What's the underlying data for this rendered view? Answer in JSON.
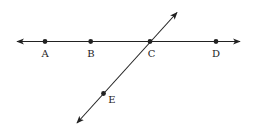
{
  "diagram": {
    "type": "geometry-lines",
    "stroke_color": "#222222",
    "lines": [
      {
        "id": "line-horizontal",
        "from": [
          17,
          41.5
        ],
        "to": [
          240,
          41.5
        ],
        "arrows": "both"
      },
      {
        "id": "line-diagonal",
        "from": [
          77,
          123
        ],
        "to": [
          177,
          12.5
        ],
        "arrows": "both"
      }
    ],
    "points": [
      {
        "id": "A",
        "label": "A",
        "x": 45,
        "y": 41.5,
        "label_x": 45,
        "label_y": 57
      },
      {
        "id": "B",
        "label": "B",
        "x": 90.7,
        "y": 41.5,
        "label_x": 91,
        "label_y": 57
      },
      {
        "id": "C",
        "label": "C",
        "x": 150,
        "y": 41.5,
        "label_x": 151.5,
        "label_y": 57
      },
      {
        "id": "D",
        "label": "D",
        "x": 216,
        "y": 41.5,
        "label_x": 216,
        "label_y": 57
      },
      {
        "id": "E",
        "label": "E",
        "x": 103.5,
        "y": 93.5,
        "label_x": 112,
        "label_y": 103
      }
    ]
  }
}
